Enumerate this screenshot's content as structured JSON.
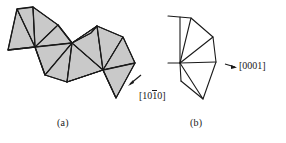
{
  "figure": {
    "kind": "crystallographic-fan-diagram",
    "background_color": "#ffffff",
    "stroke_color": "#1a1a1a",
    "fill_color": "#c9c9c9",
    "panels": [
      {
        "id": "a",
        "caption": "(a)",
        "shaded": true,
        "description": "chain of shaded triangles fanning across two hubs"
      },
      {
        "id": "b",
        "caption": "(b)",
        "shaded": false,
        "description": "unshaded triangle fan radiating from a single hub"
      }
    ],
    "labels": [
      {
        "id": "dir-1010",
        "prefix": "[10",
        "overbar": "1",
        "suffix": "0]",
        "plain": "[10-10]",
        "points_to": "panel-a"
      },
      {
        "id": "dir-0001",
        "text": "[0001]",
        "points_to": "panel-b"
      }
    ],
    "geometry": {
      "panel_a": {
        "hubs": [
          {
            "name": "hub-left",
            "x": 35,
            "y": 47
          },
          {
            "name": "hub-mid",
            "x": 72,
            "y": 43
          },
          {
            "name": "hub-right",
            "x": 103,
            "y": 70
          }
        ],
        "rim": [
          [
            17,
            9
          ],
          [
            33,
            7
          ],
          [
            58,
            25
          ],
          [
            72,
            43
          ],
          [
            91,
            33
          ],
          [
            97,
            26
          ],
          [
            123,
            37
          ],
          [
            135,
            63
          ],
          [
            116,
            98
          ],
          [
            103,
            70
          ],
          [
            67,
            82
          ],
          [
            45,
            75
          ],
          [
            35,
            47
          ],
          [
            8,
            50
          ]
        ],
        "spokes_left": [
          [
            17,
            9
          ],
          [
            33,
            7
          ],
          [
            58,
            25
          ],
          [
            72,
            43
          ],
          [
            45,
            75
          ],
          [
            8,
            50
          ]
        ],
        "spokes_mid": [
          [
            58,
            25
          ],
          [
            35,
            47
          ],
          [
            45,
            75
          ],
          [
            67,
            82
          ],
          [
            103,
            70
          ],
          [
            97,
            26
          ]
        ],
        "spokes_right": [
          [
            97,
            26
          ],
          [
            123,
            37
          ],
          [
            135,
            63
          ],
          [
            116,
            98
          ],
          [
            67,
            82
          ],
          [
            72,
            43
          ]
        ]
      },
      "panel_b": {
        "hub": {
          "x": 180,
          "y": 63
        },
        "rim": [
          [
            168,
            16
          ],
          [
            191,
            18
          ],
          [
            213,
            37
          ],
          [
            216,
            62
          ],
          [
            203,
            99
          ],
          [
            181,
            81
          ],
          [
            168,
            63
          ]
        ]
      },
      "arrows": [
        {
          "id": "arrow-a",
          "from": [
            136,
            79
          ],
          "to": [
            128,
            85
          ]
        },
        {
          "id": "arrow-b",
          "from": [
            226,
            64
          ],
          "to": [
            234,
            67
          ]
        }
      ]
    }
  }
}
